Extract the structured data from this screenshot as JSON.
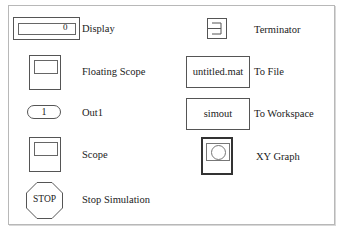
{
  "library": {
    "blocks": [
      {
        "id": "display",
        "label": "Display",
        "icon_text": "0"
      },
      {
        "id": "floating-scope",
        "label": "Floating Scope"
      },
      {
        "id": "out1",
        "label": "Out1",
        "icon_text": "1"
      },
      {
        "id": "scope",
        "label": "Scope"
      },
      {
        "id": "stop-simulation",
        "label": "Stop Simulation",
        "icon_text": "STOP"
      },
      {
        "id": "terminator",
        "label": "Terminator"
      },
      {
        "id": "to-file",
        "label": "To File",
        "icon_text": "untitled.mat"
      },
      {
        "id": "to-workspace",
        "label": "To Workspace",
        "icon_text": "simout"
      },
      {
        "id": "xy-graph",
        "label": "XY Graph"
      }
    ]
  }
}
